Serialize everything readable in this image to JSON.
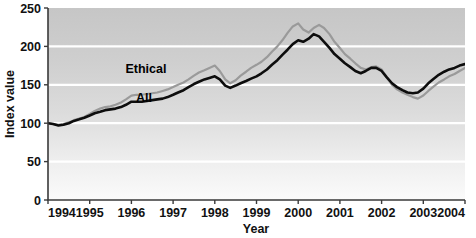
{
  "chart_data": {
    "type": "line",
    "title": "",
    "xlabel": "Year",
    "ylabel": "Index value",
    "xlim": [
      1994,
      2004
    ],
    "ylim": [
      0,
      250
    ],
    "grid": true,
    "gridlines_y": [
      50,
      100,
      150,
      200
    ],
    "legend_position": "inline-annotation",
    "x_ticks": [
      "1994",
      "1995",
      "1996",
      "1997",
      "1998",
      "1999",
      "2000",
      "2001",
      "2002",
      "2003",
      "2004"
    ],
    "y_ticks": [
      "0",
      "50",
      "100",
      "150",
      "200",
      "250"
    ],
    "series": [
      {
        "name": "Ethical",
        "color": "#9a9a9a",
        "label_x": 1996.35,
        "label_y": 166,
        "x": [
          1994.0,
          1994.12,
          1994.25,
          1994.37,
          1994.5,
          1994.62,
          1994.75,
          1994.87,
          1995.0,
          1995.12,
          1995.25,
          1995.37,
          1995.5,
          1995.62,
          1995.75,
          1995.87,
          1996.0,
          1996.12,
          1996.25,
          1996.37,
          1996.5,
          1996.62,
          1996.75,
          1996.87,
          1997.0,
          1997.12,
          1997.25,
          1997.37,
          1997.5,
          1997.62,
          1997.75,
          1997.87,
          1998.0,
          1998.12,
          1998.25,
          1998.37,
          1998.5,
          1998.62,
          1998.75,
          1998.87,
          1999.0,
          1999.12,
          1999.25,
          1999.37,
          1999.5,
          1999.62,
          1999.75,
          1999.87,
          2000.0,
          2000.12,
          2000.25,
          2000.37,
          2000.5,
          2000.62,
          2000.75,
          2000.87,
          2001.0,
          2001.12,
          2001.25,
          2001.37,
          2001.5,
          2001.62,
          2001.75,
          2001.87,
          2002.0,
          2002.12,
          2002.25,
          2002.37,
          2002.5,
          2002.62,
          2002.75,
          2002.87,
          2003.0,
          2003.12,
          2003.25,
          2003.37,
          2003.5,
          2003.62,
          2003.75,
          2003.87,
          2004.0
        ],
        "values": [
          100,
          99,
          98,
          99,
          101,
          104,
          106,
          108,
          112,
          116,
          119,
          121,
          122,
          124,
          127,
          131,
          136,
          137,
          137,
          138,
          139,
          140,
          142,
          144,
          147,
          150,
          153,
          157,
          162,
          166,
          169,
          172,
          175,
          168,
          157,
          152,
          156,
          162,
          167,
          172,
          176,
          180,
          186,
          193,
          200,
          208,
          218,
          226,
          230,
          222,
          218,
          224,
          228,
          224,
          216,
          206,
          198,
          190,
          184,
          178,
          172,
          170,
          173,
          174,
          170,
          160,
          150,
          144,
          140,
          137,
          134,
          132,
          136,
          142,
          148,
          153,
          157,
          161,
          164,
          168,
          172
        ]
      },
      {
        "name": "All",
        "color": "#0d0d0d",
        "label_x": 1996.3,
        "label_y": 128,
        "x": [
          1994.0,
          1994.12,
          1994.25,
          1994.37,
          1994.5,
          1994.62,
          1994.75,
          1994.87,
          1995.0,
          1995.12,
          1995.25,
          1995.37,
          1995.5,
          1995.62,
          1995.75,
          1995.87,
          1996.0,
          1996.12,
          1996.25,
          1996.37,
          1996.5,
          1996.62,
          1996.75,
          1996.87,
          1997.0,
          1997.12,
          1997.25,
          1997.37,
          1997.5,
          1997.62,
          1997.75,
          1997.87,
          1998.0,
          1998.12,
          1998.25,
          1998.37,
          1998.5,
          1998.62,
          1998.75,
          1998.87,
          1999.0,
          1999.12,
          1999.25,
          1999.37,
          1999.5,
          1999.62,
          1999.75,
          1999.87,
          2000.0,
          2000.12,
          2000.25,
          2000.37,
          2000.5,
          2000.62,
          2000.75,
          2000.87,
          2001.0,
          2001.12,
          2001.25,
          2001.37,
          2001.5,
          2001.62,
          2001.75,
          2001.87,
          2002.0,
          2002.12,
          2002.25,
          2002.37,
          2002.5,
          2002.62,
          2002.75,
          2002.87,
          2003.0,
          2003.12,
          2003.25,
          2003.37,
          2003.5,
          2003.62,
          2003.75,
          2003.87,
          2004.0
        ],
        "values": [
          100,
          99,
          97,
          98,
          100,
          103,
          105,
          107,
          110,
          113,
          115,
          117,
          118,
          119,
          121,
          124,
          128,
          128,
          128,
          129,
          130,
          131,
          132,
          134,
          137,
          140,
          143,
          147,
          151,
          154,
          157,
          159,
          161,
          157,
          149,
          146,
          149,
          152,
          155,
          158,
          161,
          165,
          170,
          176,
          182,
          189,
          196,
          203,
          208,
          206,
          210,
          216,
          213,
          206,
          198,
          190,
          184,
          178,
          173,
          168,
          165,
          168,
          172,
          172,
          168,
          160,
          152,
          147,
          143,
          140,
          139,
          140,
          145,
          152,
          158,
          163,
          167,
          170,
          172,
          175,
          177
        ]
      }
    ]
  },
  "axis": {
    "y_label": "Index value",
    "x_label": "Year"
  }
}
